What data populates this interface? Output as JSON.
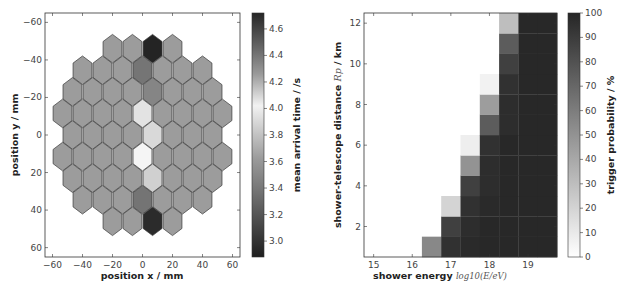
{
  "chart_data": [
    {
      "type": "heatmap",
      "subtype": "hexagonal-camera-map",
      "title": "",
      "xlabel": "position x / mm",
      "ylabel": "position y / mm",
      "xlim": [
        -65,
        65
      ],
      "ylim": [
        65,
        -65
      ],
      "y_inverted": true,
      "xticks": [
        -60,
        -40,
        -20,
        0,
        20,
        40,
        60
      ],
      "yticks": [
        -60,
        -40,
        -20,
        0,
        20,
        40,
        60
      ],
      "grid": false,
      "colorbar": {
        "label": "mean arrival time / /s",
        "range": [
          2.88,
          4.72
        ],
        "ticks": [
          3.0,
          3.2,
          3.4,
          3.6,
          3.8,
          4.0,
          4.2,
          4.4,
          4.6
        ],
        "colormap": "gray-diverging (dark low and high, light center)"
      },
      "hex_rows": [
        {
          "y": -46,
          "x": [
            -20,
            -6.7,
            6.7,
            20
          ],
          "values": [
            3.6,
            3.6,
            4.7,
            3.6
          ]
        },
        {
          "y": -34.5,
          "x": [
            -40,
            -26.7,
            -13.3,
            0,
            13.3,
            26.7,
            40
          ],
          "values": [
            3.6,
            3.6,
            3.6,
            4.45,
            3.6,
            3.6,
            3.6
          ]
        },
        {
          "y": -23,
          "x": [
            -46.7,
            -33.3,
            -20,
            -6.7,
            6.7,
            20,
            33.3,
            46.7
          ],
          "values": [
            3.6,
            3.6,
            3.6,
            3.6,
            4.4,
            3.6,
            3.6,
            3.6
          ]
        },
        {
          "y": -11.5,
          "x": [
            -53.3,
            -40,
            -26.7,
            -13.3,
            0,
            13.3,
            26.7,
            40,
            53.3
          ],
          "values": [
            3.6,
            3.6,
            3.6,
            3.6,
            3.95,
            3.6,
            3.6,
            3.6,
            3.6
          ]
        },
        {
          "y": 0,
          "x": [
            -46.7,
            -33.3,
            -20,
            -6.7,
            6.7,
            20,
            33.3,
            46.7
          ],
          "values": [
            3.6,
            3.6,
            3.6,
            3.6,
            3.9,
            3.6,
            3.6,
            3.6
          ]
        },
        {
          "y": 11.5,
          "x": [
            -53.3,
            -40,
            -26.7,
            -13.3,
            0,
            13.3,
            26.7,
            40,
            53.3
          ],
          "values": [
            3.6,
            3.6,
            3.6,
            3.6,
            4.05,
            3.6,
            3.6,
            3.6,
            3.6
          ]
        },
        {
          "y": 23,
          "x": [
            -46.7,
            -33.3,
            -20,
            -6.7,
            6.7,
            20,
            33.3,
            46.7
          ],
          "values": [
            3.6,
            3.6,
            3.6,
            3.6,
            3.85,
            3.6,
            3.6,
            3.6
          ]
        },
        {
          "y": 34.5,
          "x": [
            -40,
            -26.7,
            -13.3,
            0,
            13.3,
            26.7,
            40
          ],
          "values": [
            3.6,
            3.6,
            3.6,
            3.35,
            3.6,
            3.6,
            3.6
          ]
        },
        {
          "y": 46,
          "x": [
            -20,
            -6.7,
            6.7,
            20
          ],
          "values": [
            3.6,
            3.6,
            2.95,
            3.6
          ]
        }
      ]
    },
    {
      "type": "heatmap",
      "title": "",
      "xlabel": "shower energy log10(E/eV)",
      "ylabel": "shower-telescope distance R_p / km",
      "xlim": [
        14.75,
        19.75
      ],
      "ylim": [
        0.5,
        12.5
      ],
      "xticks": [
        15,
        16,
        17,
        18,
        19
      ],
      "yticks": [
        2,
        4,
        6,
        8,
        10,
        12
      ],
      "grid": false,
      "colorbar": {
        "label": "trigger probability / %",
        "range": [
          0,
          100
        ],
        "ticks": [
          0,
          10,
          20,
          30,
          40,
          50,
          60,
          70,
          80,
          90,
          100
        ],
        "colormap": "gray_r (white=0, black=100)"
      },
      "x_bin_centers": [
        15.0,
        15.5,
        16.0,
        16.5,
        17.0,
        17.5,
        18.0,
        18.5,
        19.0,
        19.5
      ],
      "y_bin_centers": [
        1,
        2,
        3,
        4,
        5,
        6,
        7,
        8,
        9,
        10,
        11,
        12
      ],
      "values_by_row_from_bottom": [
        [
          0,
          0,
          0,
          55,
          95,
          98,
          99,
          99,
          99,
          99
        ],
        [
          0,
          0,
          0,
          0,
          88,
          97,
          99,
          99,
          99,
          99
        ],
        [
          0,
          0,
          0,
          0,
          20,
          95,
          98,
          99,
          99,
          99
        ],
        [
          0,
          0,
          0,
          0,
          0,
          88,
          97,
          99,
          99,
          99
        ],
        [
          0,
          0,
          0,
          0,
          0,
          50,
          97,
          99,
          99,
          99
        ],
        [
          0,
          0,
          0,
          0,
          0,
          8,
          95,
          99,
          99,
          99
        ],
        [
          0,
          0,
          0,
          0,
          0,
          0,
          75,
          97,
          99,
          99
        ],
        [
          0,
          0,
          0,
          0,
          0,
          0,
          45,
          97,
          99,
          99
        ],
        [
          0,
          0,
          0,
          0,
          0,
          0,
          6,
          95,
          99,
          99
        ],
        [
          0,
          0,
          0,
          0,
          0,
          0,
          0,
          88,
          99,
          99
        ],
        [
          0,
          0,
          0,
          0,
          0,
          0,
          0,
          75,
          99,
          99
        ],
        [
          0,
          0,
          0,
          0,
          0,
          0,
          0,
          30,
          99,
          99
        ]
      ]
    }
  ],
  "labels": {
    "left_xlabel": "position x / mm",
    "left_ylabel": "position y / mm",
    "left_cbar_label": "mean arrival time / /s",
    "right_xlabel_main": "shower energy",
    "right_xlabel_math": "log10(E/eV)",
    "right_ylabel_main": "shower-telescope distance",
    "right_ylabel_math": "Rp",
    "right_ylabel_unit": "/ km",
    "right_cbar_label": "trigger probability / %"
  }
}
